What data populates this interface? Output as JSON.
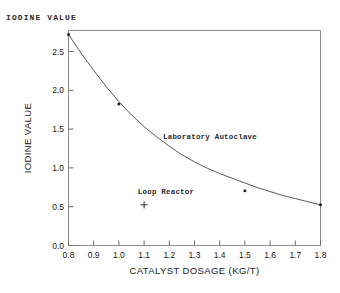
{
  "chart_data": {
    "type": "line",
    "title": "",
    "corner_title": "IODINE VALUE",
    "xlabel": "CATALYST DOSAGE (KG/T)",
    "ylabel": "IODINE VALUE",
    "xlim": [
      0.8,
      1.8
    ],
    "ylim": [
      0.0,
      2.75
    ],
    "grid": false,
    "legend": "none",
    "xticks": [
      "0.8",
      "0.9",
      "1.0",
      "1.1",
      "1.2",
      "1.3",
      "1.4",
      "1.5",
      "1.6",
      "1.7",
      "1.8"
    ],
    "xtick_values": [
      0.8,
      0.9,
      1.0,
      1.1,
      1.2,
      1.3,
      1.4,
      1.5,
      1.6,
      1.7,
      1.8
    ],
    "yticks": [
      "0.0",
      "0.5",
      "1.0",
      "1.5",
      "2.0",
      "2.5"
    ],
    "ytick_values": [
      0.0,
      0.5,
      1.0,
      1.5,
      2.0,
      2.5
    ],
    "series": [
      {
        "name": "Laboratory Autoclave",
        "style": "curve",
        "x": [
          0.8,
          0.85,
          0.9,
          0.95,
          1.0,
          1.05,
          1.1,
          1.15,
          1.2,
          1.25,
          1.3,
          1.35,
          1.4,
          1.45,
          1.5,
          1.55,
          1.6,
          1.65,
          1.7,
          1.75,
          1.8
        ],
        "y": [
          2.7,
          2.46,
          2.24,
          2.03,
          1.84,
          1.67,
          1.52,
          1.39,
          1.27,
          1.16,
          1.07,
          0.99,
          0.92,
          0.86,
          0.8,
          0.74,
          0.69,
          0.64,
          0.6,
          0.56,
          0.52
        ]
      },
      {
        "name": "Laboratory Autoclave data points",
        "style": "markers",
        "marker": "dot",
        "x": [
          0.8,
          1.0,
          1.5,
          1.8
        ],
        "y": [
          2.7,
          1.81,
          0.7,
          0.52
        ]
      },
      {
        "name": "Loop Reactor",
        "style": "markers",
        "marker": "plus",
        "x": [
          1.1
        ],
        "y": [
          0.52
        ]
      }
    ],
    "annotations": [
      {
        "text": "Laboratory Autoclave",
        "x": 1.175,
        "y": 1.36
      },
      {
        "text": "Loop Reactor",
        "x": 1.075,
        "y": 0.665
      }
    ]
  },
  "caption": {
    "cut_off_text": ""
  }
}
